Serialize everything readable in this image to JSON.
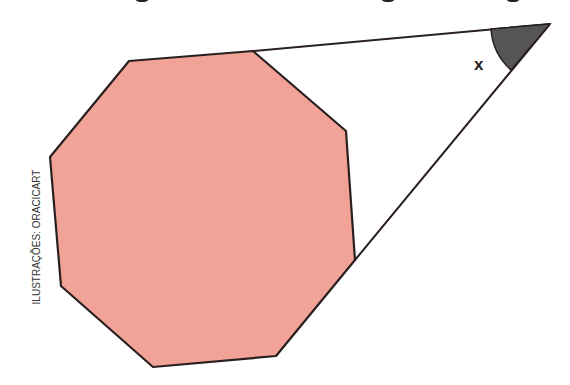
{
  "figure": {
    "angle_label": "x",
    "credit": "ILUSTRAÇÕES: ORACICART",
    "colors": {
      "octagon_fill": "#f0a396",
      "stroke": "#2a1f1f",
      "angle_fill": "#555555",
      "background": "#ffffff"
    },
    "octagon_vertices": [
      [
        129,
        61
      ],
      [
        253,
        51
      ],
      [
        346,
        131
      ],
      [
        355,
        260
      ],
      [
        276,
        356
      ],
      [
        153,
        367
      ],
      [
        61,
        286
      ],
      [
        50,
        157
      ]
    ],
    "apex": [
      550,
      24
    ]
  }
}
